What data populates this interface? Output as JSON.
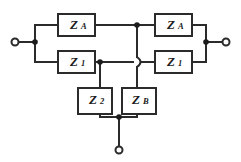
{
  "diagram": {
    "type": "electrical-circuit-schematic",
    "canvas": {
      "width": 241,
      "height": 162
    },
    "colors": {
      "background": "#ffffff",
      "wire": "#2b2b2b",
      "node": "#1c1c1c",
      "box_fill": "#ffffff",
      "label": "#1c1c1c"
    }
  },
  "components": [
    {
      "id": "za-top-left",
      "name": "impedance-za-top-left",
      "symbol": "Z",
      "subscript": "A",
      "label": "Z_A",
      "x": 58,
      "y": 14,
      "w": 37,
      "h": 22
    },
    {
      "id": "z1-bottom-left",
      "name": "impedance-z1-bottom-left",
      "symbol": "Z",
      "subscript": "1",
      "label": "Z_1",
      "x": 58,
      "y": 51,
      "w": 37,
      "h": 22
    },
    {
      "id": "za-top-right",
      "name": "impedance-za-top-right",
      "symbol": "Z",
      "subscript": "A",
      "label": "Z_A",
      "x": 155,
      "y": 14,
      "w": 37,
      "h": 22
    },
    {
      "id": "z1-bottom-right",
      "name": "impedance-z1-bottom-right",
      "symbol": "Z",
      "subscript": "1",
      "label": "Z_1",
      "x": 155,
      "y": 51,
      "w": 37,
      "h": 22
    },
    {
      "id": "z2-bottom",
      "name": "impedance-z2-shunt",
      "symbol": "Z",
      "subscript": "2",
      "label": "Z_2",
      "x": 78,
      "y": 88,
      "w": 34,
      "h": 26
    },
    {
      "id": "zb-bottom",
      "name": "impedance-zb-shunt",
      "symbol": "Z",
      "subscript": "B",
      "label": "Z_B",
      "x": 122,
      "y": 88,
      "w": 34,
      "h": 26
    }
  ],
  "terminals": [
    {
      "id": "term-left",
      "name": "terminal-left",
      "cx": 15,
      "cy": 42,
      "r": 3.5
    },
    {
      "id": "term-right",
      "name": "terminal-right",
      "cx": 226,
      "cy": 42,
      "r": 3.5
    },
    {
      "id": "term-bottom",
      "name": "terminal-bottom",
      "cx": 119,
      "cy": 150,
      "r": 3.5
    }
  ],
  "nodes": [
    {
      "id": "node-left",
      "name": "junction-left-input",
      "cx": 35,
      "cy": 42,
      "r": 2.8
    },
    {
      "id": "node-right",
      "name": "junction-right-output",
      "cx": 206,
      "cy": 42,
      "r": 2.8
    },
    {
      "id": "node-top-center",
      "name": "junction-top-center",
      "cx": 137,
      "cy": 25,
      "r": 2.8
    },
    {
      "id": "node-z2-tap",
      "name": "junction-z2-tap",
      "cx": 100,
      "cy": 62,
      "r": 2.8
    },
    {
      "id": "node-bottom",
      "name": "junction-bottom-common",
      "cx": 119,
      "cy": 117,
      "r": 2.8
    }
  ],
  "wires": [
    {
      "name": "wire-left-terminal-to-node",
      "d": "M 18.5 42 L 35 42"
    },
    {
      "name": "wire-left-vertical-bus",
      "d": "M 35 25 L 35 62"
    },
    {
      "name": "wire-left-bus-to-za",
      "d": "M 35 25 L 58 25"
    },
    {
      "name": "wire-left-bus-to-z1",
      "d": "M 35 62 L 58 62"
    },
    {
      "name": "wire-za-left-to-top-node",
      "d": "M 95 25 L 137 25"
    },
    {
      "name": "wire-z1-left-to-tap",
      "d": "M 95 62 L 100 62"
    },
    {
      "name": "wire-tap-to-hop",
      "d": "M 100 62 L 133 62"
    },
    {
      "name": "wire-hop-to-z1-right",
      "d": "M 141 62 L 155 62"
    },
    {
      "name": "wire-top-node-to-za-right",
      "d": "M 137 25 L 155 25"
    },
    {
      "name": "wire-za-right-to-bus",
      "d": "M 192 25 L 206 25"
    },
    {
      "name": "wire-z1-right-to-bus",
      "d": "M 192 62 L 206 62"
    },
    {
      "name": "wire-right-vertical-bus",
      "d": "M 206 25 L 206 62"
    },
    {
      "name": "wire-right-node-to-terminal",
      "d": "M 206 42 L 222.5 42"
    },
    {
      "name": "wire-top-node-down-to-hop",
      "d": "M 137 25 L 137 57"
    },
    {
      "name": "wire-hop-down-to-zb",
      "d": "M 137 67 L 137 88"
    },
    {
      "name": "wire-tap-down-to-z2",
      "d": "M 100 62 L 100 88"
    },
    {
      "name": "wire-z2-down-to-common",
      "d": "M 100 114 L 100 117 L 119 117"
    },
    {
      "name": "wire-zb-down-to-common",
      "d": "M 137 114 L 137 117 L 119 117"
    },
    {
      "name": "wire-common-to-bottom-term",
      "d": "M 119 117 L 119 146.5"
    }
  ],
  "crossover": {
    "name": "wire-crossover-hop",
    "description": "vertical wire hops over horizontal wire without connection",
    "d": "M 137 57 Q 144 62 137 67"
  }
}
